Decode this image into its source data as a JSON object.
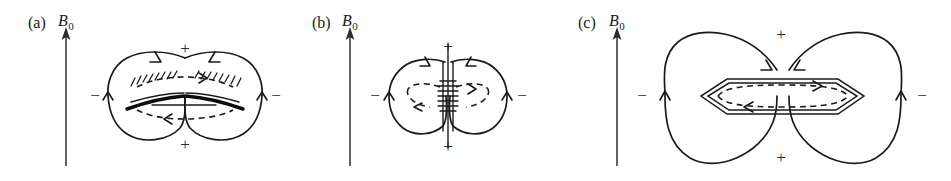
{
  "figure": {
    "background_color": "#ffffff",
    "line_color": "#1a1a1a",
    "panel_count": 3
  },
  "panels": [
    {
      "id": "a",
      "label": "(a)",
      "field_label": "B",
      "field_sub": "0",
      "polarity_top": "+",
      "polarity_bottom": "+",
      "polarity_left": "−",
      "polarity_right": "−",
      "obstacle": "thin-disc",
      "obstacle_description": "thick tapered disc edge with hatched upper boundary and dashed circulating current loop",
      "center_x": 185,
      "center_y": 96,
      "axis_x": 66,
      "axis_top_y": 28,
      "axis_bottom_y": 166
    },
    {
      "id": "b",
      "label": "(b)",
      "field_label": "B",
      "field_sub": "0",
      "polarity_top": "+",
      "polarity_bottom": "+",
      "polarity_left": "−",
      "polarity_right": "−",
      "obstacle": "vertical-sheet",
      "obstacle_description": "vertical hatched current sheet on the symmetry axis with dashed loops in each lobe",
      "center_x": 448,
      "center_y": 96,
      "axis_x": 350,
      "axis_top_y": 28,
      "axis_bottom_y": 166
    },
    {
      "id": "c",
      "label": "(c)",
      "field_label": "B",
      "field_sub": "0",
      "polarity_top": "+",
      "polarity_bottom": "+",
      "polarity_left": "−",
      "polarity_right": "−",
      "obstacle": "hexagonal-shell",
      "obstacle_description": "elongated hexagonal double-walled shell enclosing a dashed circulating current loop",
      "center_x": 785,
      "center_y": 96,
      "axis_x": 617,
      "axis_top_y": 28,
      "axis_bottom_y": 166
    }
  ],
  "annotations": {
    "axis_arrow_direction": "up",
    "lobe_arrow_left": "up",
    "lobe_arrow_right": "up",
    "top_lobe_arrows": "inward-down",
    "dashed_loop_top_arrow": "right",
    "dashed_loop_bottom_arrow": "left"
  }
}
